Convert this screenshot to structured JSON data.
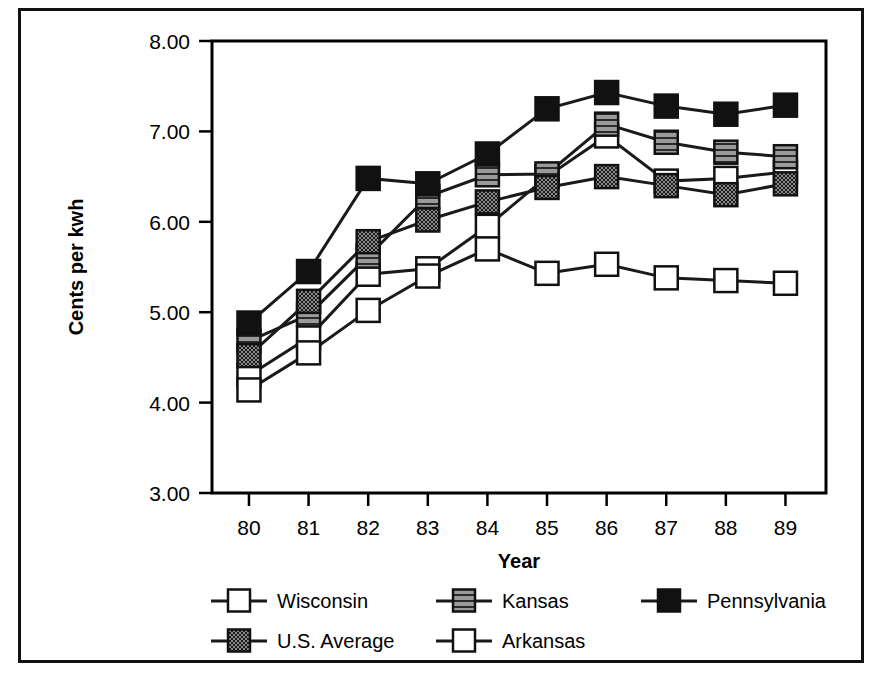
{
  "chart_data": {
    "type": "line",
    "title": "",
    "xlabel": "Year",
    "ylabel": "Cents per kwh",
    "categories": [
      "80",
      "81",
      "82",
      "83",
      "84",
      "85",
      "86",
      "87",
      "88",
      "89"
    ],
    "x": [
      80,
      81,
      82,
      83,
      84,
      85,
      86,
      87,
      88,
      89
    ],
    "ylim": [
      3.0,
      8.0
    ],
    "ytick_labels": [
      "3.00",
      "4.00",
      "5.00",
      "6.00",
      "7.00",
      "8.00"
    ],
    "yticks": [
      3.0,
      4.0,
      5.0,
      6.0,
      7.0,
      8.0
    ],
    "grid": false,
    "legend_position": "bottom",
    "series": [
      {
        "name": "Wisconsin",
        "marker": "open-square-white",
        "values": [
          4.3,
          4.72,
          5.42,
          5.48,
          5.95,
          6.5,
          6.95,
          6.45,
          6.48,
          6.55
        ]
      },
      {
        "name": "Kansas",
        "marker": "gray-hatched-square",
        "values": [
          4.68,
          4.97,
          5.62,
          6.28,
          6.52,
          6.53,
          7.08,
          6.88,
          6.77,
          6.72
        ]
      },
      {
        "name": "Pennsylvania",
        "marker": "solid-black-square",
        "values": [
          4.88,
          5.45,
          6.48,
          6.42,
          6.75,
          7.25,
          7.43,
          7.28,
          7.19,
          7.29
        ]
      },
      {
        "name": "U.S. Average",
        "marker": "dark-checkered-square",
        "values": [
          4.52,
          5.12,
          5.78,
          6.02,
          6.22,
          6.38,
          6.5,
          6.4,
          6.3,
          6.42
        ]
      },
      {
        "name": "Arkansas",
        "marker": "open-square-white",
        "values": [
          4.14,
          4.55,
          5.02,
          5.4,
          5.7,
          5.43,
          5.53,
          5.38,
          5.35,
          5.32
        ]
      }
    ]
  },
  "legend": {
    "entries": [
      {
        "label": "Wisconsin",
        "marker": "open-square-white"
      },
      {
        "label": "Kansas",
        "marker": "gray-hatched-square"
      },
      {
        "label": "Pennsylvania",
        "marker": "solid-black-square"
      },
      {
        "label": "U.S. Average",
        "marker": "dark-checkered-square"
      },
      {
        "label": "Arkansas",
        "marker": "open-square-white"
      }
    ]
  },
  "colors": {
    "line": "#1a1a1a",
    "axis": "#000000",
    "background": "#ffffff",
    "marker_black": "#111111",
    "marker_gray": "#9a9a9a",
    "marker_white": "#ffffff",
    "frame": "#111111"
  }
}
